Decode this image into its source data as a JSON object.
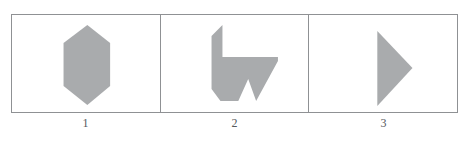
{
  "figure": {
    "background_color": "#ffffff",
    "border_color": "#8f9194",
    "shape_fill_color": "#a9abad",
    "label_color": "#55585c",
    "panel_count": 3
  },
  "panels": [
    {
      "index": 1,
      "label": "1",
      "shape_name": "hexagon",
      "shape_description": "vertically elongated hexagon",
      "vertices": [
        [
          87,
          24
        ],
        [
          110,
          42
        ],
        [
          110,
          85
        ],
        [
          87,
          104
        ],
        [
          63,
          85
        ],
        [
          63,
          42
        ]
      ]
    },
    {
      "index": 2,
      "label": "2",
      "shape_name": "arrow-polygon",
      "shape_description": "irregular arrow-like polygon with notched base",
      "vertices": [
        [
          224,
          25
        ],
        [
          224,
          57
        ],
        [
          280,
          57
        ],
        [
          280,
          61
        ],
        [
          258,
          100
        ],
        [
          250,
          79
        ],
        [
          240,
          100
        ],
        [
          222,
          100
        ],
        [
          213,
          88
        ],
        [
          213,
          36
        ]
      ]
    },
    {
      "index": 3,
      "label": "3",
      "shape_name": "triangle",
      "shape_description": "right-pointing triangle",
      "vertices": [
        [
          381,
          31
        ],
        [
          416,
          68
        ],
        [
          381,
          106
        ]
      ]
    }
  ],
  "labels": {
    "items": [
      "1",
      "2",
      "3"
    ]
  }
}
